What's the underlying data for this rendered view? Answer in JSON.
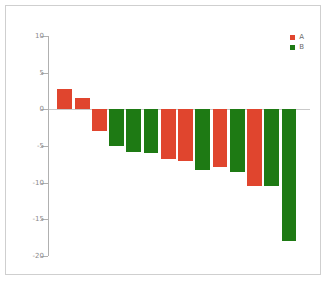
{
  "chart_data": {
    "type": "bar",
    "title": "",
    "xlabel": "",
    "ylabel": "",
    "ylim": [
      -20,
      10
    ],
    "yticks": [
      10,
      5,
      0,
      -5,
      -10,
      -15,
      -20
    ],
    "ytick_labels": [
      "10",
      "5",
      "0",
      "-5",
      "-10",
      "-15",
      "-20"
    ],
    "grid": false,
    "legend_position": "top-right",
    "categories": [
      "1",
      "2",
      "3",
      "4",
      "5",
      "6",
      "7",
      "8",
      "9",
      "10",
      "11",
      "12",
      "13",
      "14"
    ],
    "values": [
      2.8,
      1.5,
      -3.0,
      -5.0,
      -5.8,
      -6.0,
      -6.8,
      -7.0,
      -8.3,
      -7.8,
      -8.5,
      -10.5,
      -10.5,
      -18.0
    ],
    "bar_groups": [
      "A",
      "A",
      "A",
      "B",
      "B",
      "B",
      "A",
      "A",
      "B",
      "A",
      "B",
      "A",
      "B",
      "B"
    ],
    "series": [
      {
        "name": "A",
        "color": "#e0452e"
      },
      {
        "name": "B",
        "color": "#1e7a14"
      }
    ]
  },
  "legend": {
    "entries": [
      {
        "label": "A",
        "color": "#e0452e",
        "swatch": "square-marker"
      },
      {
        "label": "B",
        "color": "#1e7a14",
        "swatch": "square-marker"
      }
    ]
  },
  "colors": {
    "series_a": "#e0452e",
    "series_b": "#1e7a14",
    "axis": "#b0b0b0",
    "tick_text": "#8a8a8a",
    "frame": "#cfcfcf",
    "background": "#ffffff",
    "zero_line": "#c9c9c9"
  }
}
